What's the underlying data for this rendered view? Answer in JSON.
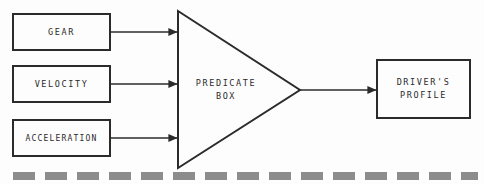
{
  "diagram": {
    "background_color": "#fdfdfd",
    "stroke_color": "#2b2b2b",
    "text_color": "#2b2b2b",
    "inputs": [
      {
        "id": "gear",
        "label": "GEAR",
        "shape": "rectangle"
      },
      {
        "id": "velocity",
        "label": "VELOCITY",
        "shape": "rectangle"
      },
      {
        "id": "acceleration",
        "label": "ACCELERATION",
        "shape": "rectangle"
      }
    ],
    "processor": {
      "id": "predicate-box",
      "shape": "triangle",
      "label_line_1": "PREDICATE",
      "label_line_2": "BOX"
    },
    "output": {
      "id": "drivers-profile",
      "shape": "rectangle",
      "label_line_1": "DRIVER'S",
      "label_line_2": "PROFILE"
    },
    "connectors": [
      {
        "id": "gear-to-predicate",
        "from": "gear",
        "to": "predicate-box",
        "arrowhead": "filled-triangle"
      },
      {
        "id": "velocity-to-predicate",
        "from": "velocity",
        "to": "predicate-box",
        "arrowhead": "filled-triangle"
      },
      {
        "id": "acceleration-to-predicate",
        "from": "acceleration",
        "to": "predicate-box",
        "arrowhead": "filled-triangle"
      },
      {
        "id": "predicate-to-output",
        "from": "predicate-box",
        "to": "drivers-profile",
        "arrowhead": "filled-triangle"
      }
    ],
    "footer_rule": {
      "id": "dashed-divider",
      "style": "dashed",
      "color": "#8c8c8c",
      "thickness_px": 8,
      "dash_px": 22,
      "gap_px": 10
    }
  }
}
